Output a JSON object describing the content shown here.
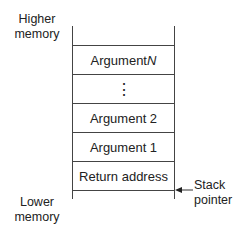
{
  "labels": {
    "top": [
      "Higher",
      "memory"
    ],
    "bottom": [
      "Lower",
      "memory"
    ],
    "pointer": [
      "Stack",
      "pointer"
    ]
  },
  "stack": [
    {
      "text": "Argument ",
      "italic": "N"
    },
    {
      "text": "⋮",
      "italic": ""
    },
    {
      "text": "Argument 2",
      "italic": ""
    },
    {
      "text": "Argument 1",
      "italic": ""
    },
    {
      "text": "Return address",
      "italic": ""
    }
  ]
}
